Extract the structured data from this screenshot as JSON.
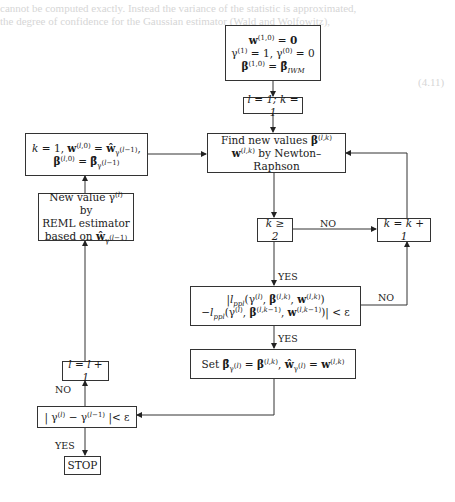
{
  "background_text": [
    "cannot be computed exactly. Instead the variance of the statistic is approximated,",
    "the degree of confidence for the Gaussian estimator (Wald and Wolfowitz),",
    "(4.11)"
  ],
  "nodes": {
    "init": {
      "line1": "w(1,0) = 0",
      "line2": "γ(1) = 1, γ(0) = 0",
      "line3": "β(1,0) = β̂IWM"
    },
    "set_counters": {
      "text": "l = 1; k = 1"
    },
    "newton": {
      "line1": "Find new values β(l,k)",
      "line2": "w(l,k) by Newton–Raphson"
    },
    "reset": {
      "line1": "k = 1, w(l,0) = ŵγ(l−1),",
      "line2": "β(l,0) = β̂γ(l−1)"
    },
    "reml": {
      "line1": "New value γ(l) by",
      "line2": "REML estimator",
      "line3": "based on ŵγ(l−1)"
    },
    "k_check": {
      "text": "k ≥ 2"
    },
    "k_increment": {
      "text": "k = k + 1"
    },
    "convergence": {
      "line1": "|lppl(γ(l), β(l,k), w(l,k))",
      "line2": "−lppl(γ(l), β(l,k−1), w(l,k−1))| < ε"
    },
    "set_estimates": {
      "text": "Set β̂γ(l) = β(l,k), ŵγ(l) = w(l,k)"
    },
    "l_increment": {
      "text": "l = l + 1"
    },
    "gamma_check": {
      "text": "| γ(l) − γ(l−1) |< ε"
    },
    "stop": {
      "text": "STOP"
    }
  },
  "edge_labels": {
    "k_check_no": "NO",
    "k_check_yes": "YES",
    "convergence_no": "NO",
    "convergence_yes": "YES",
    "gamma_check_no": "NO",
    "gamma_check_yes": "YES"
  }
}
